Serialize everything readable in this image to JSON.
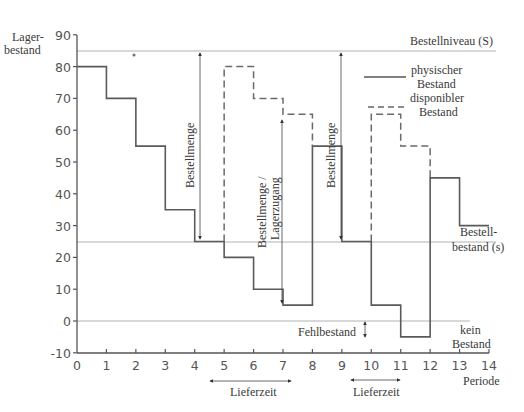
{
  "chart_data": {
    "type": "line",
    "subtype": "step",
    "title": "",
    "xlabel": "Periode",
    "ylabel": "Lager-bestand",
    "ylabel_lines": [
      "Lager-",
      "bestand"
    ],
    "xlim": [
      0,
      14
    ],
    "ylim": [
      -10,
      90
    ],
    "x_ticks": [
      "0",
      "1",
      "2",
      "3",
      "4",
      "5",
      "6",
      "7",
      "8",
      "9",
      "10",
      "11",
      "12",
      "13",
      "14"
    ],
    "y_ticks": [
      "90",
      "80",
      "70",
      "60",
      "50",
      "40",
      "30",
      "20",
      "10",
      "0",
      "-10"
    ],
    "grid": false,
    "series": [
      {
        "name": "physischer Bestand",
        "style": "solid",
        "segments": [
          {
            "x": [
              0,
              1
            ],
            "y": 80
          },
          {
            "x": [
              1,
              2
            ],
            "y": 70
          },
          {
            "x": [
              2,
              3
            ],
            "y": 55
          },
          {
            "x": [
              3,
              4
            ],
            "y": 35
          },
          {
            "x": [
              4,
              5
            ],
            "y": 25
          },
          {
            "x": [
              5,
              6
            ],
            "y": 20
          },
          {
            "x": [
              6,
              7
            ],
            "y": 10
          },
          {
            "x": [
              7,
              8
            ],
            "y": 5
          },
          {
            "x": [
              8,
              9
            ],
            "y": 55
          },
          {
            "x": [
              9,
              10
            ],
            "y": 25
          },
          {
            "x": [
              10,
              11
            ],
            "y": 5
          },
          {
            "x": [
              11,
              12
            ],
            "y": -5
          },
          {
            "x": [
              12,
              13
            ],
            "y": 45
          },
          {
            "x": [
              13,
              14
            ],
            "y": 30
          }
        ]
      },
      {
        "name": "disponibler Bestand",
        "style": "dashed",
        "segments": [
          {
            "x": [
              5,
              6
            ],
            "y": 80
          },
          {
            "x": [
              6,
              7
            ],
            "y": 70
          },
          {
            "x": [
              7,
              8
            ],
            "y": 65
          },
          {
            "x": [
              10,
              11
            ],
            "y": 65
          },
          {
            "x": [
              11,
              12
            ],
            "y": 55
          }
        ]
      }
    ],
    "reference_lines": [
      {
        "label": "Bestellniveau (S)",
        "y": 85
      },
      {
        "label": "Bestell-bestand (s)",
        "label_lines": [
          "Bestell-",
          "bestand (s)"
        ],
        "y": 25
      },
      {
        "label": "kein Bestand",
        "label_lines": [
          "kein",
          "Bestand"
        ],
        "y": 0
      }
    ],
    "annotations": [
      {
        "text": "Bestellmenge",
        "orientation": "vertical",
        "x": 4.5,
        "y_range": [
          25,
          85
        ]
      },
      {
        "text": "Bestellmenge / Lagerzugang",
        "lines": [
          "Bestellmenge /",
          "Lagerzugang"
        ],
        "orientation": "vertical",
        "x": 7.5,
        "y_range": [
          5,
          65
        ]
      },
      {
        "text": "Bestellmenge",
        "orientation": "vertical",
        "x": 9.6,
        "y_range": [
          25,
          85
        ]
      },
      {
        "text": "Fehlbestand",
        "x": 10.5,
        "y_range": [
          -5,
          0
        ]
      },
      {
        "text": "Lieferzeit",
        "x_range": [
          5,
          8
        ]
      },
      {
        "text": "Lieferzeit",
        "x_range": [
          10,
          12
        ]
      }
    ],
    "legend": {
      "position": "upper right",
      "entries": [
        {
          "label": "physischer Bestand",
          "lines": [
            "physischer",
            "Bestand"
          ],
          "style": "solid"
        },
        {
          "label": "disponibler Bestand",
          "lines": [
            "disponibler",
            "Bestand"
          ],
          "style": "dashed"
        }
      ]
    },
    "colors": {
      "line": "#555555",
      "ref_line": "#9a9a9a",
      "text": "#3a3a3a"
    }
  }
}
